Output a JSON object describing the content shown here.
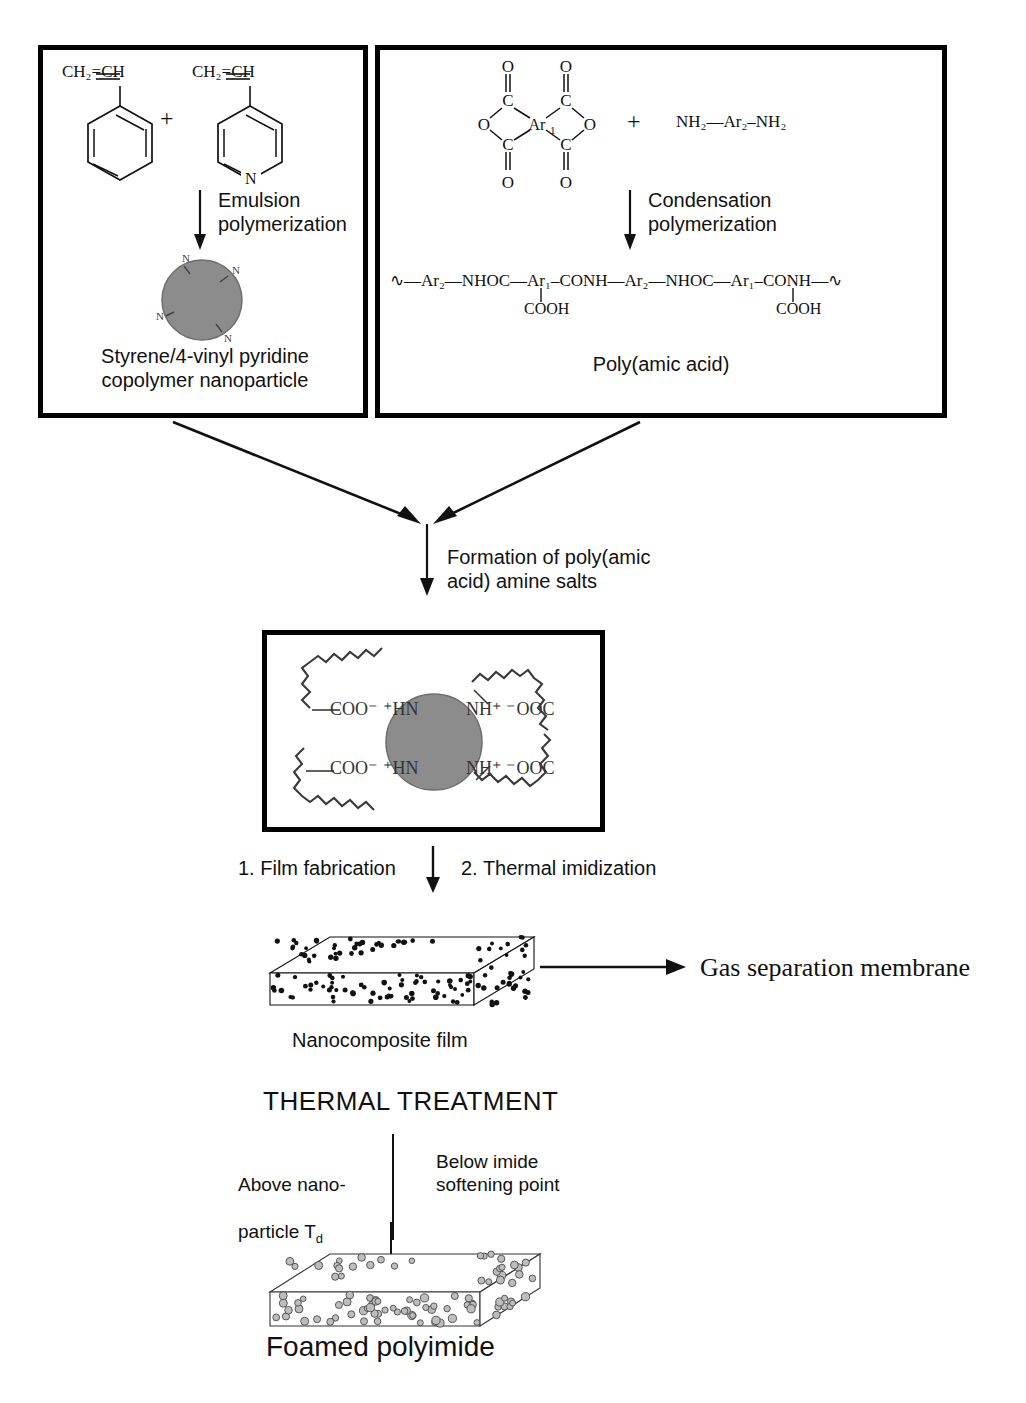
{
  "figure": {
    "type": "process-flow-diagram"
  },
  "colors": {
    "ink": "#111111",
    "box_border": "#000000",
    "nanoparticle_fill": "#8c8c8c",
    "nanoparticle_stroke": "#555555",
    "background": "#ffffff",
    "void_fill": "#bdbdbd"
  },
  "box_left": {
    "name": "Styrene/4-vinyl pyridine copolymer nanoparticle synthesis",
    "monomer_1": {
      "vinyl_label": "CH₂=CH",
      "ring": "benzene",
      "ring_label": ""
    },
    "plus": "+",
    "monomer_2": {
      "vinyl_label": "CH₂=CH",
      "ring": "pyridine",
      "ring_label": "N"
    },
    "arrow_label": "Emulsion\npolymerization",
    "particle_labels": [
      "N",
      "N",
      "N",
      "N"
    ],
    "caption": "Styrene/4-vinyl pyridine\ncopolymer nanoparticle"
  },
  "box_right": {
    "name": "Poly(amic acid) synthesis",
    "dianhydride": {
      "center": "Ar₁",
      "oxygens": [
        "O",
        "O",
        "O",
        "O"
      ],
      "carbonyls": [
        "C",
        "C",
        "C",
        "C"
      ],
      "ring_oxygens": [
        "O",
        "O"
      ]
    },
    "plus": "+",
    "diamine": "NH₂—Ar₂–NH₂",
    "arrow_label": "Condensation\npolymerization",
    "chain": {
      "segments": [
        "Ar₂",
        "NHOC",
        "Ar₁",
        "CONH",
        "Ar₂",
        "NHOC",
        "Ar₁",
        "CONH"
      ],
      "pendant": "COOH",
      "pendant_count": 2,
      "text": "∿—Ar₂—NHOC—Ar₁–CONH—Ar₂—NHOC—Ar₁–CONH—∿"
    },
    "caption": "Poly(amic acid)"
  },
  "merge_step": {
    "arrow_label": "Formation of poly(amic\nacid) amine salts"
  },
  "box_salt": {
    "name": "Poly(amic acid) amine salt complex",
    "row_1_left": "COO⁻ ⁺HN",
    "row_1_right": "NH⁺ ⁻OOC",
    "row_2_left": "COO⁻ ⁺HN",
    "row_2_right": "NH⁺ ⁻OOC",
    "left_label_1": "COO",
    "chains": 4
  },
  "imidization_step": {
    "label_left": "1. Film fabrication",
    "label_right": "2. Thermal imidization"
  },
  "film": {
    "caption": "Nanocomposite film",
    "filler": "solid nanoparticles",
    "dot_count": 140
  },
  "membrane_arrow": {
    "label": "Gas separation membrane"
  },
  "thermal_treatment": {
    "heading": "THERMAL TREATMENT",
    "label_left": "Above nano-\nparticle Td",
    "label_left_text": "Above nano-",
    "label_left_text2": "particle T",
    "label_left_sub": "d",
    "label_right": "Below imide\nsoftening point"
  },
  "foam": {
    "caption": "Foamed   polyimide",
    "filler": "hollow voids",
    "void_count": 95
  }
}
